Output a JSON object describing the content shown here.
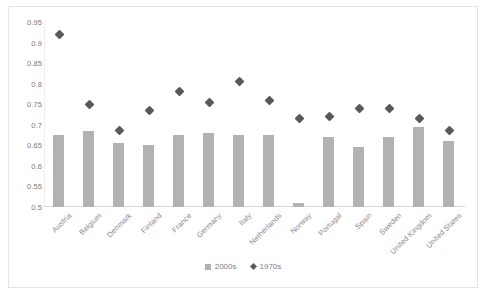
{
  "chart_data": {
    "type": "bar",
    "title": "",
    "xlabel": "",
    "ylabel": "",
    "ylim": [
      0.5,
      0.95
    ],
    "ytick_step": 0.05,
    "yticks": [
      "0.95",
      "0.9",
      "0.85",
      "0.8",
      "0.75",
      "0.7",
      "0.65",
      "0.6",
      "0.55",
      "0.5"
    ],
    "grid": false,
    "legend_position": "bottom-center",
    "categories": [
      "Austria",
      "Belgium",
      "Denmark",
      "Finland",
      "France",
      "Germany",
      "Italy",
      "Netherlands",
      "Norway",
      "Portugal",
      "Spain",
      "Sweden",
      "United Kingdom",
      "United States"
    ],
    "series": [
      {
        "name": "2000s",
        "marker": "bar",
        "color": "#b2b2b2",
        "values": [
          0.675,
          0.685,
          0.655,
          0.65,
          0.675,
          0.68,
          0.675,
          0.675,
          0.51,
          0.67,
          0.645,
          0.67,
          0.695,
          0.66
        ]
      },
      {
        "name": "1970s",
        "marker": "diamond",
        "color": "#595959",
        "values": [
          0.92,
          0.75,
          0.685,
          0.735,
          0.78,
          0.755,
          0.805,
          0.76,
          0.715,
          0.72,
          0.74,
          0.74,
          0.715,
          0.685
        ]
      }
    ]
  },
  "legend": {
    "items": [
      {
        "label": "2000s",
        "icon": "square-marker-icon"
      },
      {
        "label": "1970s",
        "icon": "diamond-marker-icon"
      }
    ]
  }
}
